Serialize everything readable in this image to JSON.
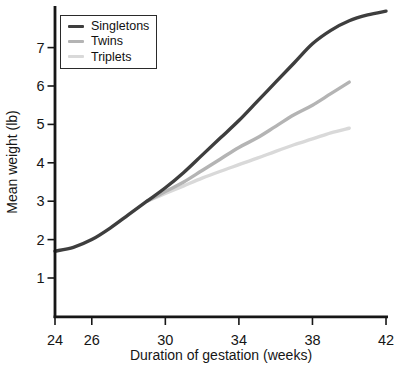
{
  "figure": {
    "background": "#ffffff",
    "axis_color": "#161616"
  },
  "chart_data": {
    "type": "line",
    "title": "",
    "xlabel": "Duration of gestation (weeks)",
    "ylabel": "Mean weight (lb)",
    "xlim": [
      24,
      42.2
    ],
    "ylim": [
      0,
      8.1
    ],
    "x_ticks": [
      24,
      26,
      30,
      34,
      38,
      42
    ],
    "y_ticks": [
      1,
      2,
      3,
      4,
      5,
      6,
      7
    ],
    "grid": false,
    "legend_position": "top-left",
    "series": [
      {
        "name": "Triplets",
        "color": "#d9d9d9",
        "x": [
          29,
          30,
          31,
          32,
          33,
          34,
          35,
          36,
          37,
          38,
          39,
          40
        ],
        "y": [
          3.0,
          3.2,
          3.4,
          3.6,
          3.78,
          3.95,
          4.12,
          4.3,
          4.47,
          4.62,
          4.78,
          4.9
        ]
      },
      {
        "name": "Twins",
        "color": "#b4b4b4",
        "x": [
          29,
          30,
          31,
          32,
          33,
          34,
          35,
          36,
          37,
          38,
          39,
          40
        ],
        "y": [
          3.0,
          3.25,
          3.5,
          3.8,
          4.1,
          4.4,
          4.65,
          4.95,
          5.25,
          5.5,
          5.8,
          6.1
        ]
      },
      {
        "name": "Singletons",
        "color": "#3e3e3e",
        "x": [
          24,
          25,
          26,
          27,
          28,
          29,
          30,
          31,
          32,
          33,
          34,
          35,
          36,
          37,
          38,
          39,
          40,
          41,
          42
        ],
        "y": [
          1.7,
          1.8,
          2.0,
          2.3,
          2.65,
          3.0,
          3.35,
          3.75,
          4.2,
          4.65,
          5.1,
          5.6,
          6.1,
          6.6,
          7.1,
          7.45,
          7.7,
          7.85,
          7.95
        ]
      }
    ],
    "legend_order": [
      "Singletons",
      "Twins",
      "Triplets"
    ]
  }
}
